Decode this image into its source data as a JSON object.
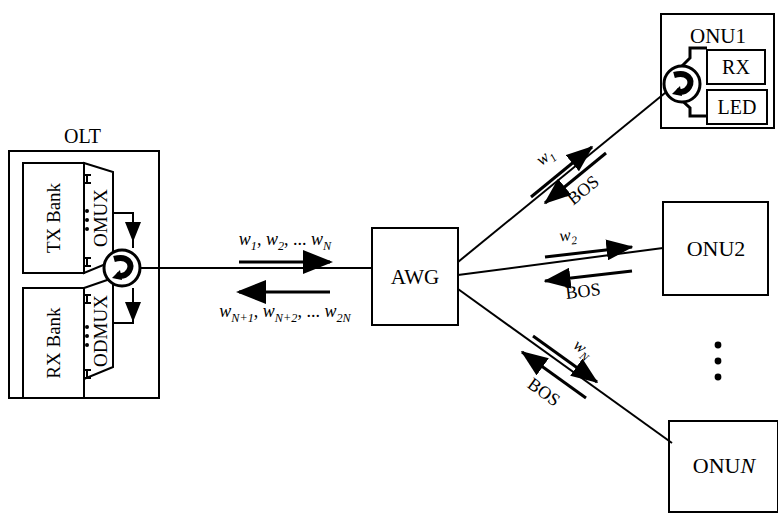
{
  "diagram": {
    "stroke_color": "#000000",
    "background_color": "#ffffff"
  },
  "olt": {
    "label": "OLT",
    "tx_bank": "TX Bank",
    "rx_bank": "RX Bank",
    "omux": "OMUX",
    "odmux": "ODMUX",
    "circulator_icon": "optical-circulator-icon",
    "vertical_dots": "⋮"
  },
  "awg": {
    "label": "AWG"
  },
  "trunk": {
    "downstream_label_prefix": "w",
    "downstream_label": "w1, w2, ... wN",
    "downstream_terms": [
      {
        "base": "w",
        "sub": "1",
        "sep": ","
      },
      {
        "base": "w",
        "sub": "2",
        "sep": ","
      },
      {
        "base": "",
        "sub": "",
        "sep": "..."
      },
      {
        "base": "w",
        "sub": "N",
        "sep": ""
      }
    ],
    "upstream_label": "wN+1, wN+2, ... w2N",
    "upstream_terms": [
      {
        "base": "w",
        "sub": "N+1",
        "sep": ","
      },
      {
        "base": "w",
        "sub": "N+2",
        "sep": ","
      },
      {
        "base": "",
        "sub": "",
        "sep": "..."
      },
      {
        "base": "w",
        "sub": "2N",
        "sep": ""
      }
    ]
  },
  "branches": [
    {
      "id": "branch-1",
      "downstream_base": "w",
      "downstream_sub": "1",
      "upstream_label": "BOS",
      "onu": "ONU1"
    },
    {
      "id": "branch-2",
      "downstream_base": "w",
      "downstream_sub": "2",
      "upstream_label": "BOS",
      "onu": "ONU2"
    },
    {
      "id": "branch-n",
      "downstream_base": "w",
      "downstream_sub": "N",
      "upstream_label": "BOS",
      "onu_prefix": "ONU",
      "onu_suffix": "N"
    }
  ],
  "onu1": {
    "title": "ONU1",
    "rx": "RX",
    "led": "LED",
    "circulator_icon": "optical-circulator-icon"
  },
  "onu2": {
    "title": "ONU2"
  },
  "onun": {
    "title_prefix": "ONU",
    "title_suffix": "N"
  },
  "ellipsis": {
    "vertical_dots": "ellipsis-vertical"
  }
}
